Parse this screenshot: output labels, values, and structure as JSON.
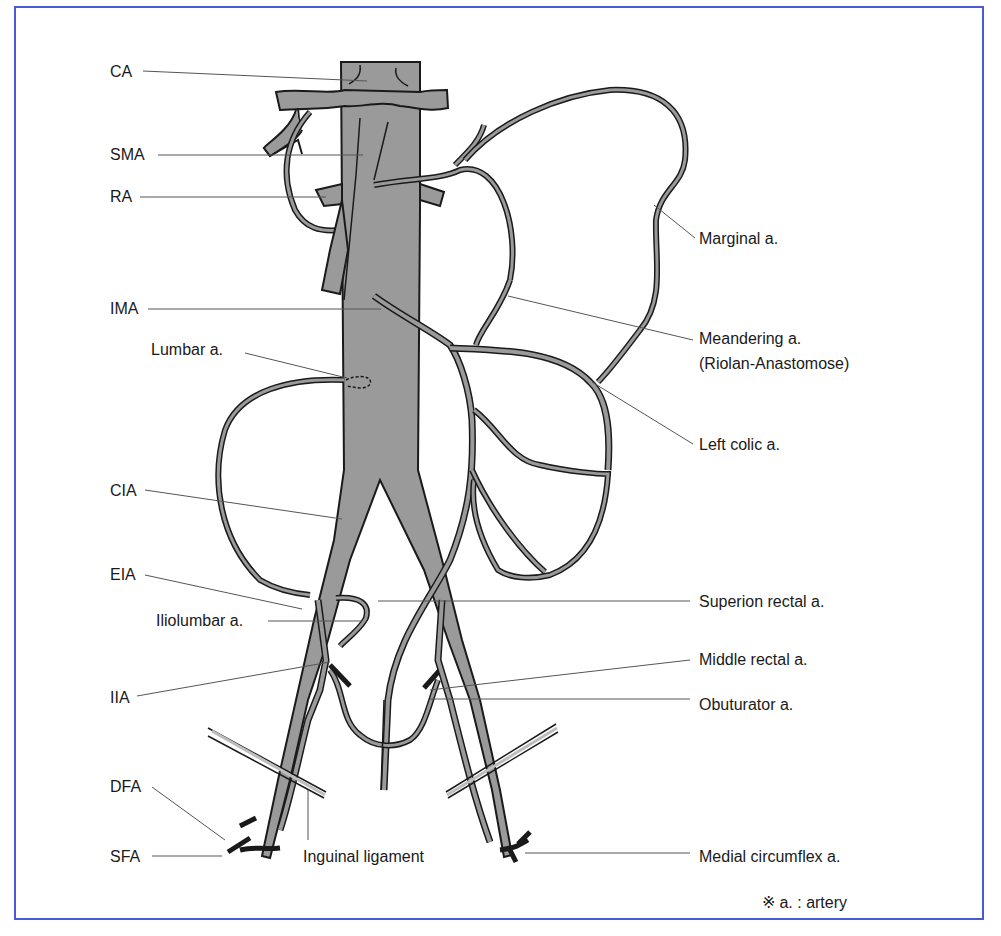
{
  "colors": {
    "frame_border": "#4a5ad6",
    "vessel_fill": "#9a9a9a",
    "vessel_outline": "#1a1a1a",
    "leader_line": "#555555",
    "background": "#ffffff"
  },
  "labels_left": {
    "ca": "CA",
    "sma": "SMA",
    "ra": "RA",
    "ima": "IMA",
    "lumbar": "Lumbar a.",
    "cia": "CIA",
    "eia": "EIA",
    "iliolumbar": "Iliolumbar a.",
    "iia": "IIA",
    "dfa": "DFA",
    "sfa": "SFA"
  },
  "labels_right": {
    "marginal": "Marginal a.",
    "meandering": "Meandering a.",
    "riolan": "(Riolan-Anastomose)",
    "left_colic": "Left colic a.",
    "superior_rectal": "Superion rectal a.",
    "middle_rectal": "Middle rectal a.",
    "obturator": "Obuturator a.",
    "medial_circumflex": "Medial circumflex a."
  },
  "labels_bottom": {
    "inguinal_ligament": "Inguinal ligament"
  },
  "footnote": {
    "symbol": "※",
    "text": "a. : artery"
  }
}
